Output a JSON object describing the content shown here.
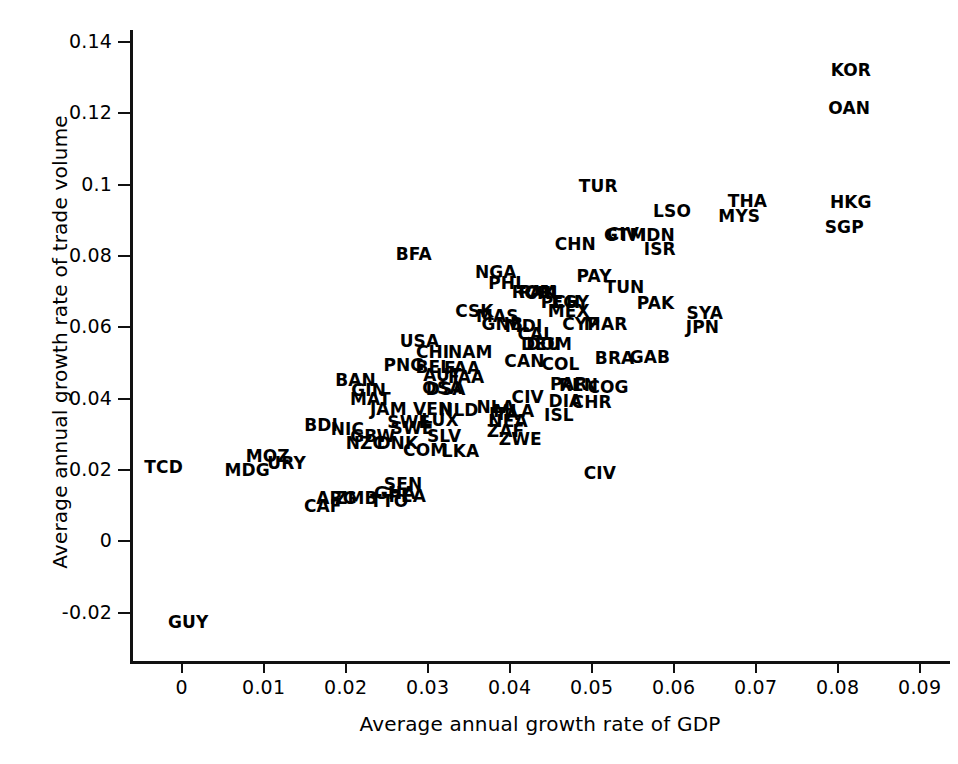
{
  "chart_data": {
    "type": "scatter",
    "title": "",
    "xlabel": "Average annual growth rate of GDP",
    "ylabel": "Average annual growth rate of trade volume",
    "xlim": [
      -0.0063,
      0.0937
    ],
    "ylim": [
      -0.0335,
      0.1433
    ],
    "grid": false,
    "legend": null,
    "marker_style": "text-label-only",
    "xticks": [
      "0",
      "0.01",
      "0.02",
      "0.03",
      "0.04",
      "0.05",
      "0.06",
      "0.07",
      "0.08",
      "0.09"
    ],
    "xtick_values": [
      0,
      0.01,
      0.02,
      0.03,
      0.04,
      0.05,
      0.06,
      0.07,
      0.08,
      0.09
    ],
    "yticks": [
      "0.14",
      "0.12",
      "0.1",
      "0.08",
      "0.06",
      "0.04",
      "0.02",
      "0",
      "-0.02"
    ],
    "ytick_values": [
      0.14,
      0.12,
      0.1,
      0.08,
      0.06,
      0.04,
      0.02,
      0,
      -0.02
    ],
    "points": [
      {
        "label": "KOR",
        "x": 0.0816,
        "y": 0.132
      },
      {
        "label": "OAN",
        "x": 0.0814,
        "y": 0.1215
      },
      {
        "label": "TUR",
        "x": 0.0508,
        "y": 0.0996
      },
      {
        "label": "THA",
        "x": 0.069,
        "y": 0.0955
      },
      {
        "label": "HKG",
        "x": 0.0816,
        "y": 0.095
      },
      {
        "label": "LSO",
        "x": 0.0598,
        "y": 0.0925
      },
      {
        "label": "MYS",
        "x": 0.068,
        "y": 0.0913
      },
      {
        "label": "SGP",
        "x": 0.0808,
        "y": 0.088
      },
      {
        "label": "CIV",
        "x": 0.0538,
        "y": 0.0862
      },
      {
        "label": "GTM",
        "x": 0.0541,
        "y": 0.086
      },
      {
        "label": "IDN",
        "x": 0.058,
        "y": 0.0858
      },
      {
        "label": "CHN",
        "x": 0.048,
        "y": 0.0833
      },
      {
        "label": "ISR",
        "x": 0.0583,
        "y": 0.082
      },
      {
        "label": "BFA",
        "x": 0.0283,
        "y": 0.0806
      },
      {
        "label": "NGA",
        "x": 0.0383,
        "y": 0.0755
      },
      {
        "label": "PAY",
        "x": 0.0503,
        "y": 0.0743
      },
      {
        "label": "PHL",
        "x": 0.0397,
        "y": 0.0723
      },
      {
        "label": "TUN",
        "x": 0.054,
        "y": 0.0714
      },
      {
        "label": "PAK",
        "x": 0.0434,
        "y": 0.07
      },
      {
        "label": "ROM",
        "x": 0.043,
        "y": 0.0698
      },
      {
        "label": "CHL",
        "x": 0.0441,
        "y": 0.0697
      },
      {
        "label": "EGY",
        "x": 0.0474,
        "y": 0.0672
      },
      {
        "label": "PCH",
        "x": 0.0462,
        "y": 0.067
      },
      {
        "label": "PAK",
        "x": 0.0578,
        "y": 0.0668
      },
      {
        "label": "CSK",
        "x": 0.0357,
        "y": 0.0645
      },
      {
        "label": "MAS",
        "x": 0.0385,
        "y": 0.0632
      },
      {
        "label": "MEX",
        "x": 0.0472,
        "y": 0.0645
      },
      {
        "label": "SYA",
        "x": 0.0638,
        "y": 0.0639
      },
      {
        "label": "GNB",
        "x": 0.0391,
        "y": 0.0608
      },
      {
        "label": "MDI",
        "x": 0.0417,
        "y": 0.0605
      },
      {
        "label": "CYP",
        "x": 0.0487,
        "y": 0.0608
      },
      {
        "label": "MAR",
        "x": 0.0517,
        "y": 0.0608
      },
      {
        "label": "JPN",
        "x": 0.0635,
        "y": 0.06
      },
      {
        "label": "CAL",
        "x": 0.0432,
        "y": 0.058
      },
      {
        "label": "USA",
        "x": 0.029,
        "y": 0.0563
      },
      {
        "label": "DOM",
        "x": 0.0448,
        "y": 0.0552
      },
      {
        "label": "DEU",
        "x": 0.0438,
        "y": 0.0553
      },
      {
        "label": "CHI",
        "x": 0.0306,
        "y": 0.0531
      },
      {
        "label": "NAM",
        "x": 0.0352,
        "y": 0.053
      },
      {
        "label": "CAN",
        "x": 0.0418,
        "y": 0.0505
      },
      {
        "label": "COL",
        "x": 0.0462,
        "y": 0.0497
      },
      {
        "label": "BRA",
        "x": 0.0528,
        "y": 0.0513
      },
      {
        "label": "GAB",
        "x": 0.0571,
        "y": 0.0518
      },
      {
        "label": "PNG",
        "x": 0.0271,
        "y": 0.0493
      },
      {
        "label": "BEL",
        "x": 0.0307,
        "y": 0.049
      },
      {
        "label": "FAA",
        "x": 0.0342,
        "y": 0.0487
      },
      {
        "label": "AUT",
        "x": 0.0318,
        "y": 0.0465
      },
      {
        "label": "FAA",
        "x": 0.0347,
        "y": 0.0462
      },
      {
        "label": "BAN",
        "x": 0.0212,
        "y": 0.0453
      },
      {
        "label": "PAR",
        "x": 0.0472,
        "y": 0.044
      },
      {
        "label": "REN",
        "x": 0.0484,
        "y": 0.0438
      },
      {
        "label": "COG",
        "x": 0.052,
        "y": 0.0433
      },
      {
        "label": "GIN",
        "x": 0.0228,
        "y": 0.0424
      },
      {
        "label": "OSA",
        "x": 0.0318,
        "y": 0.043
      },
      {
        "label": "DSA",
        "x": 0.0322,
        "y": 0.0426
      },
      {
        "label": "MAT",
        "x": 0.023,
        "y": 0.0399
      },
      {
        "label": "CIV",
        "x": 0.0422,
        "y": 0.0404
      },
      {
        "label": "DIA",
        "x": 0.0468,
        "y": 0.0393
      },
      {
        "label": "CHR",
        "x": 0.05,
        "y": 0.0391
      },
      {
        "label": "JAM",
        "x": 0.0252,
        "y": 0.037
      },
      {
        "label": "VEN",
        "x": 0.0306,
        "y": 0.0372
      },
      {
        "label": "NLD",
        "x": 0.0338,
        "y": 0.0369
      },
      {
        "label": "NLA",
        "x": 0.0383,
        "y": 0.0376
      },
      {
        "label": "MLA",
        "x": 0.0405,
        "y": 0.0366
      },
      {
        "label": "ITA",
        "x": 0.0393,
        "y": 0.0358
      },
      {
        "label": "ISL",
        "x": 0.046,
        "y": 0.0355
      },
      {
        "label": "LUX",
        "x": 0.0315,
        "y": 0.0341
      },
      {
        "label": "SWE",
        "x": 0.0277,
        "y": 0.0335
      },
      {
        "label": "NEA",
        "x": 0.0398,
        "y": 0.0337
      },
      {
        "label": "SWE",
        "x": 0.0281,
        "y": 0.0317
      },
      {
        "label": "NIC",
        "x": 0.0202,
        "y": 0.0314
      },
      {
        "label": "BDI",
        "x": 0.017,
        "y": 0.0325
      },
      {
        "label": "ZAF",
        "x": 0.0395,
        "y": 0.031
      },
      {
        "label": "SLV",
        "x": 0.032,
        "y": 0.0295
      },
      {
        "label": "GBW",
        "x": 0.0233,
        "y": 0.0295
      },
      {
        "label": "ZWE",
        "x": 0.0413,
        "y": 0.0286
      },
      {
        "label": "NZC",
        "x": 0.0224,
        "y": 0.0276
      },
      {
        "label": "DNK",
        "x": 0.0263,
        "y": 0.0276
      },
      {
        "label": "COM",
        "x": 0.0297,
        "y": 0.0256
      },
      {
        "label": "LKA",
        "x": 0.034,
        "y": 0.0254
      },
      {
        "label": "MOZ",
        "x": 0.0105,
        "y": 0.0239
      },
      {
        "label": "URY",
        "x": 0.0128,
        "y": 0.0221
      },
      {
        "label": "TCD",
        "x": -0.0022,
        "y": 0.0209
      },
      {
        "label": "MDG",
        "x": 0.008,
        "y": 0.02
      },
      {
        "label": "CIV",
        "x": 0.051,
        "y": 0.0192
      },
      {
        "label": "SEN",
        "x": 0.027,
        "y": 0.016
      },
      {
        "label": "GHA",
        "x": 0.026,
        "y": 0.0137
      },
      {
        "label": "PEA",
        "x": 0.0275,
        "y": 0.0126
      },
      {
        "label": "ARG",
        "x": 0.0189,
        "y": 0.0123
      },
      {
        "label": "ZMB",
        "x": 0.0213,
        "y": 0.0122
      },
      {
        "label": "TTO",
        "x": 0.0253,
        "y": 0.0114
      },
      {
        "label": "CAF",
        "x": 0.0172,
        "y": 0.01
      },
      {
        "label": "GUY",
        "x": 0.0008,
        "y": -0.0225
      }
    ]
  }
}
